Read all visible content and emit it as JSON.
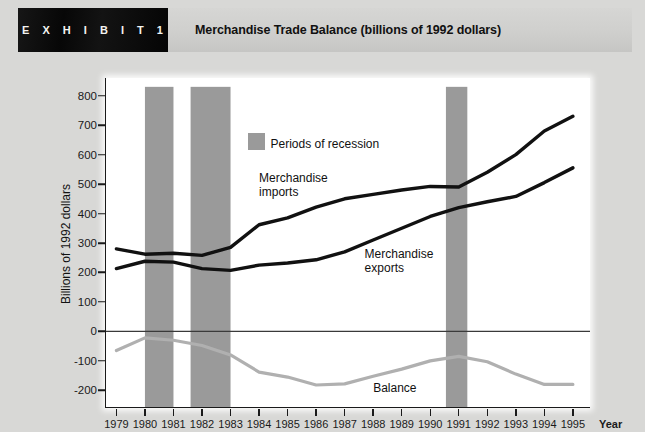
{
  "exhibit": {
    "tab_label": "E X H I B I T   1",
    "title": "Merchandise Trade Balance (billions of 1992 dollars)"
  },
  "legend": {
    "recession_label": "Periods of recession",
    "recession_color": "#9a9a9a"
  },
  "annotations": {
    "imports_line1": "Merchandise",
    "imports_line2": "imports",
    "exports_line1": "Merchandise",
    "exports_line2": "exports",
    "balance": "Balance"
  },
  "chart_data": {
    "type": "line",
    "title": "Merchandise Trade Balance (billions of 1992 dollars)",
    "xlabel": "Year",
    "ylabel": "Billions of 1992 dollars",
    "xlim": [
      1978.6,
      1995.6
    ],
    "ylim": [
      -260,
      860
    ],
    "yticks": [
      800,
      700,
      600,
      500,
      400,
      300,
      200,
      100,
      0,
      -100,
      -200
    ],
    "ytick_labels": [
      "800",
      "700",
      "600",
      "500",
      "400",
      "300",
      "200",
      "100",
      "0",
      "-100",
      "-200"
    ],
    "grid": false,
    "legend_position": "inside-top-center",
    "x": [
      1979,
      1980,
      1981,
      1982,
      1983,
      1984,
      1985,
      1986,
      1987,
      1988,
      1989,
      1990,
      1991,
      1992,
      1993,
      1994,
      1995
    ],
    "xtick_labels": [
      "1979",
      "1980",
      "1981",
      "1982",
      "1983",
      "1984",
      "1985",
      "1986",
      "1987",
      "1988",
      "1989",
      "1990",
      "1991",
      "1992",
      "1993",
      "1994",
      "1995"
    ],
    "series": [
      {
        "name": "Merchandise imports",
        "color": "#111111",
        "width": 3.4,
        "values": [
          280,
          262,
          265,
          258,
          285,
          362,
          385,
          422,
          450,
          465,
          480,
          492,
          490,
          540,
          600,
          680,
          730
        ]
      },
      {
        "name": "Merchandise exports",
        "color": "#111111",
        "width": 3.4,
        "values": [
          213,
          238,
          235,
          213,
          207,
          225,
          232,
          243,
          270,
          310,
          350,
          390,
          420,
          440,
          458,
          505,
          555
        ]
      },
      {
        "name": "Balance",
        "color": "#b0b0b0",
        "width": 3.2,
        "values": [
          -65,
          -22,
          -30,
          -48,
          -80,
          -138,
          -155,
          -182,
          -178,
          -152,
          -128,
          -100,
          -85,
          -103,
          -145,
          -180,
          -180
        ]
      }
    ],
    "shaded_regions": [
      {
        "label": "Periods of recession",
        "start": 1980.0,
        "end": 1981.0,
        "color": "#9a9a9a",
        "top": 830,
        "bottom": -260
      },
      {
        "label": "Periods of recession",
        "start": 1981.6,
        "end": 1983.0,
        "color": "#9a9a9a",
        "top": 830,
        "bottom": -260
      },
      {
        "label": "Periods of recession",
        "start": 1990.55,
        "end": 1991.3,
        "color": "#9a9a9a",
        "top": 830,
        "bottom": -260
      }
    ],
    "zero_line": 0
  }
}
